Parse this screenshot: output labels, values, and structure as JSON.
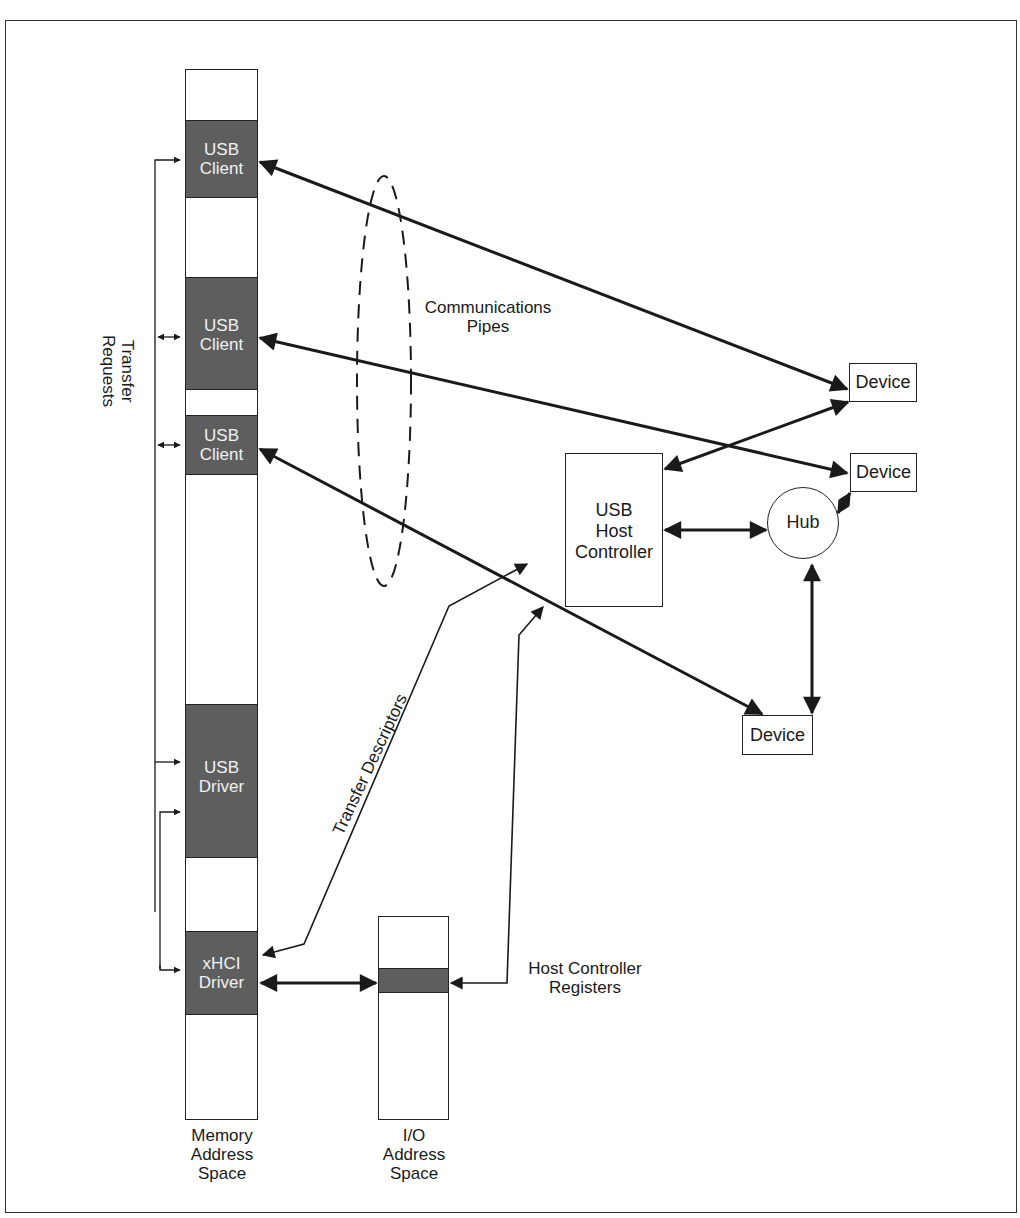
{
  "colors": {
    "block_fill": "#5e5e5e",
    "line": "#1a1a1a",
    "background": "#ffffff",
    "block_text": "#f2f2f2"
  },
  "memory_space": {
    "label_line1": "Memory",
    "label_line2": "Address",
    "label_line3": "Space",
    "blocks": [
      {
        "line1": "USB",
        "line2": "Client"
      },
      {
        "line1": "USB",
        "line2": "Client"
      },
      {
        "line1": "USB",
        "line2": "Client"
      },
      {
        "line1": "USB",
        "line2": "Driver"
      },
      {
        "line1": "xHCI",
        "line2": "Driver"
      }
    ]
  },
  "io_space": {
    "label_line1": "I/O",
    "label_line2": "Address",
    "label_line3": "Space"
  },
  "labels": {
    "transfer_requests_line1": "Transfer",
    "transfer_requests_line2": "Requests",
    "communications_pipes_line1": "Communications",
    "communications_pipes_line2": "Pipes",
    "transfer_descriptors": "Transfer Descriptors",
    "host_controller_registers_line1": "Host Controller",
    "host_controller_registers_line2": "Registers"
  },
  "host_controller": {
    "line1": "USB",
    "line2": "Host",
    "line3": "Controller"
  },
  "hub": {
    "label": "Hub"
  },
  "devices": [
    {
      "label": "Device"
    },
    {
      "label": "Device"
    },
    {
      "label": "Device"
    }
  ]
}
